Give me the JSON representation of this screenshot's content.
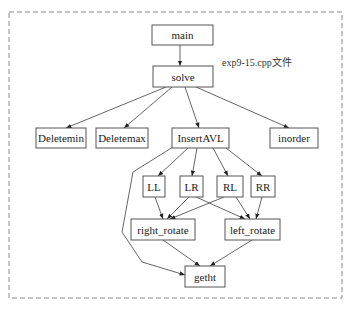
{
  "diagram": {
    "type": "call-graph",
    "caption": "exp9-15.cpp文件",
    "frame": {
      "x": 9,
      "y": 12,
      "w": 333,
      "h": 286,
      "style": "dashed"
    },
    "colors": {
      "stroke": "#555555",
      "frame": "#8a8a8a",
      "background": "#ffffff",
      "text": "#222222"
    },
    "nodes": [
      {
        "id": "main",
        "label": "main",
        "x": 152,
        "y": 25,
        "w": 61,
        "h": 20
      },
      {
        "id": "solve",
        "label": "solve",
        "x": 153,
        "y": 66,
        "w": 60,
        "h": 21
      },
      {
        "id": "Deletemin",
        "label": "Deletemin",
        "x": 36,
        "y": 128,
        "w": 50,
        "h": 20
      },
      {
        "id": "Deletemax",
        "label": "Deletemax",
        "x": 96,
        "y": 128,
        "w": 52,
        "h": 20
      },
      {
        "id": "InsertAVL",
        "label": "InsertAVL",
        "x": 172,
        "y": 128,
        "w": 57,
        "h": 20
      },
      {
        "id": "inorder",
        "label": "inorder",
        "x": 270,
        "y": 128,
        "w": 48,
        "h": 20
      },
      {
        "id": "LL",
        "label": "LL",
        "x": 143,
        "y": 176,
        "w": 22,
        "h": 21
      },
      {
        "id": "LR",
        "label": "LR",
        "x": 180,
        "y": 176,
        "w": 23,
        "h": 21
      },
      {
        "id": "RL",
        "label": "RL",
        "x": 217,
        "y": 176,
        "w": 26,
        "h": 21
      },
      {
        "id": "RR",
        "label": "RR",
        "x": 251,
        "y": 176,
        "w": 24,
        "h": 21
      },
      {
        "id": "right_rotate",
        "label": "right_rotate",
        "x": 131,
        "y": 219,
        "w": 64,
        "h": 21
      },
      {
        "id": "left_rotate",
        "label": "left_rotate",
        "x": 225,
        "y": 219,
        "w": 55,
        "h": 21
      },
      {
        "id": "getht",
        "label": "getht",
        "x": 185,
        "y": 266,
        "w": 40,
        "h": 21
      }
    ],
    "edges": [
      {
        "from": "main",
        "to": "solve",
        "points": [
          [
            180,
            45
          ],
          [
            180,
            66
          ]
        ]
      },
      {
        "from": "solve",
        "to": "Deletemin",
        "points": [
          [
            166,
            87
          ],
          [
            66,
            128
          ]
        ]
      },
      {
        "from": "solve",
        "to": "Deletemax",
        "points": [
          [
            172,
            87
          ],
          [
            124,
            128
          ]
        ]
      },
      {
        "from": "solve",
        "to": "InsertAVL",
        "points": [
          [
            185,
            87
          ],
          [
            199,
            128
          ]
        ]
      },
      {
        "from": "solve",
        "to": "inorder",
        "points": [
          [
            196,
            87
          ],
          [
            289,
            128
          ]
        ]
      },
      {
        "from": "InsertAVL",
        "to": "LL",
        "points": [
          [
            188,
            148
          ],
          [
            158,
            176
          ]
        ]
      },
      {
        "from": "InsertAVL",
        "to": "LR",
        "points": [
          [
            197,
            148
          ],
          [
            192,
            176
          ]
        ]
      },
      {
        "from": "InsertAVL",
        "to": "RL",
        "points": [
          [
            213,
            148
          ],
          [
            228,
            176
          ]
        ]
      },
      {
        "from": "InsertAVL",
        "to": "RR",
        "points": [
          [
            226,
            148
          ],
          [
            262,
            176
          ]
        ]
      },
      {
        "from": "InsertAVL",
        "to": "getht",
        "points": [
          [
            173,
            147
          ],
          [
            133,
            172
          ],
          [
            122,
            232
          ],
          [
            142,
            262
          ],
          [
            185,
            275
          ]
        ]
      },
      {
        "from": "LL",
        "to": "right_rotate",
        "points": [
          [
            155,
            197
          ],
          [
            163,
            219
          ]
        ]
      },
      {
        "from": "LR",
        "to": "right_rotate",
        "points": [
          [
            189,
            197
          ],
          [
            167,
            219
          ]
        ]
      },
      {
        "from": "LR",
        "to": "left_rotate",
        "points": [
          [
            196,
            197
          ],
          [
            245,
            219
          ]
        ]
      },
      {
        "from": "RL",
        "to": "right_rotate",
        "points": [
          [
            224,
            197
          ],
          [
            170,
            219
          ]
        ]
      },
      {
        "from": "RL",
        "to": "left_rotate",
        "points": [
          [
            236,
            197
          ],
          [
            250,
            219
          ]
        ]
      },
      {
        "from": "RR",
        "to": "left_rotate",
        "points": [
          [
            262,
            197
          ],
          [
            256,
            219
          ]
        ]
      },
      {
        "from": "right_rotate",
        "to": "getht",
        "points": [
          [
            163,
            240
          ],
          [
            200,
            266
          ]
        ]
      },
      {
        "from": "left_rotate",
        "to": "getht",
        "points": [
          [
            252,
            240
          ],
          [
            210,
            266
          ]
        ]
      }
    ]
  }
}
